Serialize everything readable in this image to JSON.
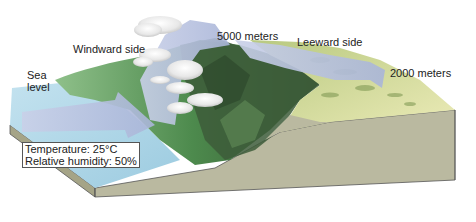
{
  "diagram": {
    "labels": {
      "sea_level_line1": "Sea",
      "sea_level_line2": "level",
      "windward": "Windward side",
      "peak_altitude": "5000 meters",
      "leeward": "Leeward side",
      "leeward_altitude": "2000 meters"
    },
    "infobox": {
      "temperature": "Temperature: 25°C",
      "humidity": "Relative humidity: 50%"
    },
    "colors": {
      "air_arrow": "#b4bfdd",
      "sea": "#a9d3e6",
      "windward_vegetation": "#4f8a4c",
      "mountain_dark": "#3c5a38",
      "leeward_land": "#dfe0a6",
      "block_side": "#b9b8a0",
      "cloud": "#f2f2f2"
    }
  }
}
